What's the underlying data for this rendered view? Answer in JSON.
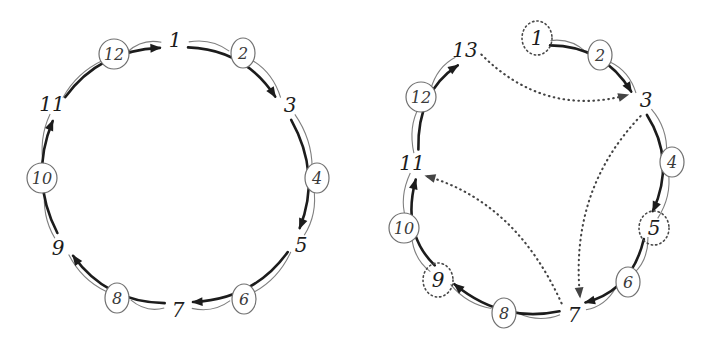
{
  "figure": {
    "type": "diagram",
    "panels": [
      {
        "id": "left",
        "name": "left-diagram",
        "center": [
          175,
          172
        ],
        "rx": 128,
        "ry": 133,
        "vertices": [
          {
            "label": "1",
            "x": 175,
            "y": 40,
            "angle": -90,
            "dotted": false
          },
          {
            "label": "3",
            "x": 290,
            "y": 105,
            "angle": -30,
            "dotted": false
          },
          {
            "label": "5",
            "x": 301,
            "y": 245,
            "angle": 30,
            "dotted": false
          },
          {
            "label": "7",
            "x": 178,
            "y": 310,
            "angle": 90,
            "dotted": false
          },
          {
            "label": "9",
            "x": 58,
            "y": 248,
            "angle": 150,
            "dotted": false
          },
          {
            "label": "11",
            "x": 52,
            "y": 104,
            "angle": -150,
            "dotted": false
          }
        ],
        "edge_labels": [
          {
            "label": "2",
            "x": 243,
            "y": 53
          },
          {
            "label": "4",
            "x": 317,
            "y": 178
          },
          {
            "label": "6",
            "x": 244,
            "y": 299
          },
          {
            "label": "8",
            "x": 117,
            "y": 298
          },
          {
            "label": "10",
            "x": 42,
            "y": 178
          },
          {
            "label": "12",
            "x": 114,
            "y": 54
          }
        ],
        "solid_arrows": [
          {
            "from": "1",
            "to": "3"
          },
          {
            "from": "3",
            "to": "5"
          },
          {
            "from": "5",
            "to": "7"
          },
          {
            "from": "7",
            "to": "9"
          },
          {
            "from": "9",
            "to": "11"
          },
          {
            "from": "11",
            "to": "1"
          }
        ],
        "dotted_arrows": []
      },
      {
        "id": "right",
        "name": "right-diagram",
        "center": [
          531,
          175
        ],
        "rx": 125,
        "ry": 133,
        "vertices": [
          {
            "label": "1",
            "x": 537,
            "y": 38,
            "angle": -88,
            "dotted": true
          },
          {
            "label": "3",
            "x": 646,
            "y": 100,
            "angle": -30,
            "dotted": false
          },
          {
            "label": "5",
            "x": 654,
            "y": 228,
            "angle": 27,
            "dotted": true
          },
          {
            "label": "7",
            "x": 574,
            "y": 315,
            "angle": 82,
            "dotted": false
          },
          {
            "label": "9",
            "x": 438,
            "y": 280,
            "angle": 142,
            "dotted": true
          },
          {
            "label": "11",
            "x": 412,
            "y": 163,
            "angle": -170,
            "dotted": false
          },
          {
            "label": "13",
            "x": 465,
            "y": 50,
            "angle": -120,
            "dotted": false
          }
        ],
        "edge_labels": [
          {
            "label": "2",
            "x": 600,
            "y": 55
          },
          {
            "label": "4",
            "x": 672,
            "y": 162
          },
          {
            "label": "6",
            "x": 628,
            "y": 282
          },
          {
            "label": "8",
            "x": 504,
            "y": 313
          },
          {
            "label": "10",
            "x": 404,
            "y": 228
          },
          {
            "label": "12",
            "x": 421,
            "y": 97
          }
        ],
        "solid_arrows": [
          {
            "from": "1",
            "to": "3"
          },
          {
            "from": "3",
            "to": "5"
          },
          {
            "from": "5",
            "to": "7"
          },
          {
            "from": "7",
            "to": "9"
          },
          {
            "from": "9",
            "to": "11"
          },
          {
            "from": "11",
            "to": "13"
          }
        ],
        "dotted_arrows": [
          {
            "from": "13",
            "to": "3"
          },
          {
            "from": "3",
            "to": "7"
          },
          {
            "from": "7",
            "to": "11"
          }
        ]
      }
    ],
    "colors": {
      "background": "#ffffff",
      "vertex_text": "#1c1c1c",
      "edge_label_text": "#3a3a3a",
      "ring_stroke": "#808080",
      "solid_arrow": "#1c1c1c",
      "dotted_arrow": "#444444",
      "dotted_circle": "#4a4a4a"
    }
  }
}
